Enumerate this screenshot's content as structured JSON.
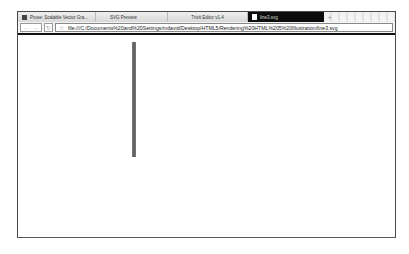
{
  "browser": {
    "tabs": [
      {
        "label": "Prose: Scalable Vector Gra...",
        "icon": "site-favicon-icon",
        "active": false
      },
      {
        "label": "SVG Preview",
        "icon": "",
        "active": false
      },
      {
        "label": "Trivit Editor v1.4",
        "icon": "",
        "active": false
      },
      {
        "label": "line3.svg",
        "icon": "page-icon",
        "active": true
      }
    ],
    "new_tab_label": "+",
    "toolbar": {
      "back_label": "←",
      "forward_label": "→",
      "reload_label": "↻",
      "star_label": "☆",
      "url": "file:///C:/Documents%20and%20Settings/mdavid/Desktop/HTML5/Rendering%20HTML%205%20Illustration/line3.svg"
    }
  },
  "content": {
    "svg_line": {
      "color": "#666666",
      "orientation": "vertical",
      "stroke_width": 4
    }
  }
}
